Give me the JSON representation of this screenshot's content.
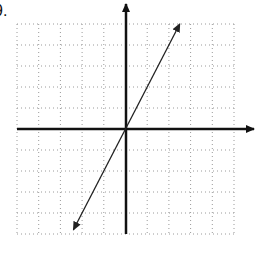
{
  "problem": {
    "label": "9."
  },
  "colors": {
    "grid": "#9a9a9a",
    "axis": "#111111",
    "line": "#222222",
    "background": "#ffffff"
  },
  "chart_data": {
    "type": "line",
    "title": "",
    "xlabel": "",
    "ylabel": "",
    "xlim": [
      -5,
      5
    ],
    "ylim": [
      -5,
      5
    ],
    "grid": true,
    "grid_style": "dotted",
    "tick_labels": false,
    "legend": null,
    "series": [
      {
        "name": "y = 2x",
        "equation": "y = 2x",
        "slope": 2,
        "intercept": 0,
        "x": [
          -2.4,
          2.5
        ],
        "y": [
          -4.8,
          5.0
        ],
        "arrows_both_ends": true
      }
    ],
    "axes": {
      "x_arrow": "positive-end",
      "y_arrow": "positive-end"
    }
  }
}
